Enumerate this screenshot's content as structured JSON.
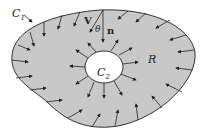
{
  "diagram": {
    "type": "region-with-hole",
    "outer_boundary_label": "C",
    "outer_boundary_sub": "1",
    "inner_boundary_label": "C",
    "inner_boundary_sub": "2",
    "region_label": "R",
    "vector_label": "V",
    "normal_label": "n",
    "angle_label": "θ",
    "colors": {
      "region_fill": "#c8c8c8",
      "hole_fill": "#ffffff",
      "stroke": "#333333"
    }
  }
}
